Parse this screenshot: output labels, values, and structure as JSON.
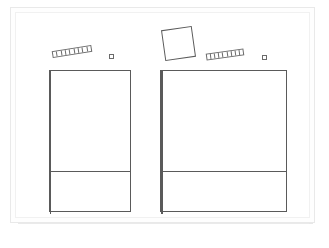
{
  "canvas": {
    "title": "Untitled Drawing",
    "background_color": "#ffffff",
    "paper_color": "#fefefe",
    "stroke_color": "#5a5a5a",
    "width": 329,
    "height": 248
  },
  "shapes": [
    {
      "id": "segmented-bar-left",
      "name": "segmented-bar",
      "label": "",
      "segments": 9,
      "x": 52,
      "y": 48,
      "width": 40,
      "height": 7,
      "rotation_deg": -9
    },
    {
      "id": "tiny-square-left",
      "name": "tiny-square",
      "label": "",
      "x": 109,
      "y": 54,
      "width": 5,
      "height": 5,
      "rotation_deg": 0
    },
    {
      "id": "tilted-square",
      "name": "tilted-square",
      "label": "",
      "x": 163,
      "y": 28,
      "width": 31,
      "height": 31,
      "rotation_deg": -8
    },
    {
      "id": "segmented-bar-right",
      "name": "segmented-bar",
      "label": "",
      "segments": 9,
      "x": 206,
      "y": 51,
      "width": 38,
      "height": 7,
      "rotation_deg": -8
    },
    {
      "id": "tiny-square-right",
      "name": "tiny-square",
      "label": "",
      "x": 262,
      "y": 55,
      "width": 5,
      "height": 5,
      "rotation_deg": 0
    },
    {
      "id": "grid-unit-left",
      "name": "grid-unit",
      "label": "",
      "x": 49,
      "y": 70,
      "width": 82,
      "height": 142,
      "columns": 2,
      "upper_height": 100,
      "lower_height": 42,
      "rotation_deg": 0
    },
    {
      "id": "grid-unit-right",
      "name": "grid-unit",
      "label": "",
      "x": 160,
      "y": 70,
      "width": 127,
      "height": 142,
      "columns": 3,
      "upper_height": 100,
      "lower_height": 42,
      "rotation_deg": 0
    }
  ]
}
